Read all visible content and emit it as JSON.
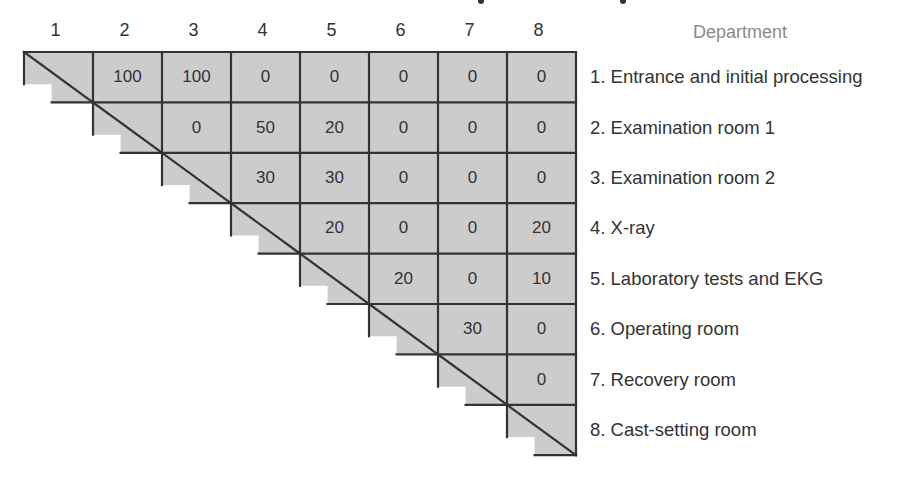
{
  "title": {
    "visible_text": "",
    "note_fragments_x": [
      478,
      620
    ]
  },
  "columns": {
    "header_labels": [
      "1",
      "2",
      "3",
      "4",
      "5",
      "6",
      "7",
      "8"
    ]
  },
  "departments": {
    "header": "Department",
    "items": [
      "1. Entrance and initial processing",
      "2. Examination room 1",
      "3. Examination room 2",
      "4. X-ray",
      "5. Laboratory tests and EKG",
      "6. Operating room",
      "7. Recovery room",
      "8. Cast-setting room"
    ]
  },
  "matrix": {
    "size": 8,
    "cells": [
      [
        null,
        "100",
        "100",
        "0",
        "0",
        "0",
        "0",
        "0"
      ],
      [
        null,
        null,
        "0",
        "50",
        "20",
        "0",
        "0",
        "0"
      ],
      [
        null,
        null,
        null,
        "30",
        "30",
        "0",
        "0",
        "0"
      ],
      [
        null,
        null,
        null,
        null,
        "20",
        "0",
        "0",
        "20"
      ],
      [
        null,
        null,
        null,
        null,
        null,
        "20",
        "0",
        "10"
      ],
      [
        null,
        null,
        null,
        null,
        null,
        null,
        "30",
        "0"
      ],
      [
        null,
        null,
        null,
        null,
        null,
        null,
        null,
        "0"
      ],
      [
        null,
        null,
        null,
        null,
        null,
        null,
        null,
        null
      ]
    ]
  },
  "colors": {
    "cell_fill": "#cccccc",
    "line": "#333333",
    "text": "#333333",
    "header_muted": "#8a8a8a"
  },
  "chart_data": {
    "type": "table",
    "title": "",
    "row_labels": [
      "1. Entrance and initial processing",
      "2. Examination room 1",
      "3. Examination room 2",
      "4. X-ray",
      "5. Laboratory tests and EKG",
      "6. Operating room",
      "7. Recovery room",
      "8. Cast-setting room"
    ],
    "column_labels": [
      "1",
      "2",
      "3",
      "4",
      "5",
      "6",
      "7",
      "8"
    ],
    "values": [
      [
        null,
        100,
        100,
        0,
        0,
        0,
        0,
        0
      ],
      [
        null,
        null,
        0,
        50,
        20,
        0,
        0,
        0
      ],
      [
        null,
        null,
        null,
        30,
        30,
        0,
        0,
        0
      ],
      [
        null,
        null,
        null,
        null,
        20,
        0,
        0,
        20
      ],
      [
        null,
        null,
        null,
        null,
        null,
        20,
        0,
        10
      ],
      [
        null,
        null,
        null,
        null,
        null,
        null,
        30,
        0
      ],
      [
        null,
        null,
        null,
        null,
        null,
        null,
        null,
        0
      ],
      [
        null,
        null,
        null,
        null,
        null,
        null,
        null,
        null
      ]
    ]
  }
}
